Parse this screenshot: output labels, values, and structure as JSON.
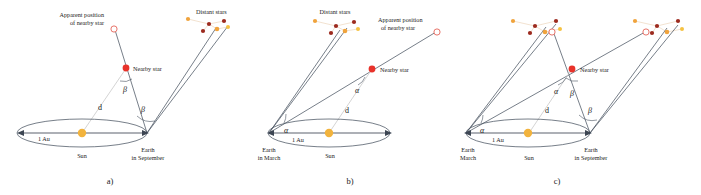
{
  "figure": {
    "colors": {
      "nearby_star": "#e8322a",
      "apparent_star_outline": "#e8746a",
      "sun": "#f2b33d",
      "star_orange": "#f0a33c",
      "star_darkred": "#9c2a1e",
      "star_yellow": "#f5c242",
      "ray": "#4a5462",
      "dline": "#c9c9c9",
      "cluster_link": "#e8c9a8",
      "text": "#1a1a1a"
    }
  },
  "labels": {
    "apparent_position_line1": "Apparent position",
    "apparent_position_line2": "of nearby star",
    "distant_stars": "Distant stars",
    "nearby_star": "Nearby star",
    "one_au": "1 Au",
    "sun": "Sun",
    "distance_d": "d",
    "alpha": "α",
    "beta": "β",
    "earth_line1": "Earth",
    "earth_march_line2": "in March",
    "earth_september_line2": "in September"
  },
  "panels": [
    {
      "id": "a",
      "caption": "a)",
      "earth_label": {
        "line1": "Earth",
        "line2": "in September"
      },
      "sun_label": "Sun",
      "baseline_label": "1 Au",
      "distance_label": "d",
      "nearby_star_label": "Nearby star",
      "apparent_label": {
        "line1": "Apparent position",
        "line2": "of nearby star"
      },
      "distant_stars_label": "Distant stars",
      "angles": [
        "β",
        "β"
      ],
      "angle_at_star": "β",
      "angle_at_earth": "β"
    },
    {
      "id": "b",
      "caption": "b)",
      "earth_label": {
        "line1": "Earth",
        "line2": "in March"
      },
      "sun_label": "Sun",
      "baseline_label": "1 Au",
      "distance_label": "d",
      "nearby_star_label": "Nearby star",
      "apparent_label": {
        "line1": "Apparent position",
        "line2": "of nearby star"
      },
      "distant_stars_label": "Distant stars",
      "angles": [
        "α",
        "α"
      ],
      "angle_at_star": "α",
      "angle_at_earth": "α"
    },
    {
      "id": "c",
      "caption": "c)",
      "earth_left_label": {
        "line1": "Earth",
        "line2": "March"
      },
      "earth_right_label": {
        "line1": "Earth",
        "line2": "in September"
      },
      "sun_label": "Sun",
      "baseline_label": "1 Au",
      "distance_label": "d",
      "nearby_star_label": "Nearby star",
      "angles": [
        "α",
        "β",
        "α",
        "β"
      ],
      "angle_star_alpha": "α",
      "angle_star_beta": "β",
      "angle_earth_left": "α",
      "angle_earth_right": "β"
    }
  ]
}
